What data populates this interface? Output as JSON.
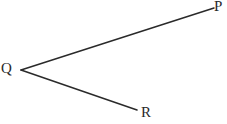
{
  "figure": {
    "type": "geometry-angle-diagram",
    "width": 227,
    "height": 124,
    "background_color": "#ffffff",
    "stroke_color": "#2a2a2a",
    "stroke_width": 1.5,
    "label_color": "#2a2a2a",
    "vertex": {
      "name": "Q",
      "label": "Q",
      "x": 21,
      "y": 70
    },
    "rays": [
      {
        "name": "ray-QP",
        "from": {
          "x": 21,
          "y": 70
        },
        "to": {
          "x": 214,
          "y": 8
        },
        "endpoint_label": "P",
        "clipped_at_edge": true
      },
      {
        "name": "ray-QR",
        "from": {
          "x": 21,
          "y": 70
        },
        "to": {
          "x": 137,
          "y": 110
        },
        "endpoint_label": "R",
        "clipped_at_edge": false
      }
    ],
    "labels": {
      "vertex": "Q",
      "upper_ray_endpoint": "P",
      "lower_ray_endpoint": "R"
    }
  }
}
